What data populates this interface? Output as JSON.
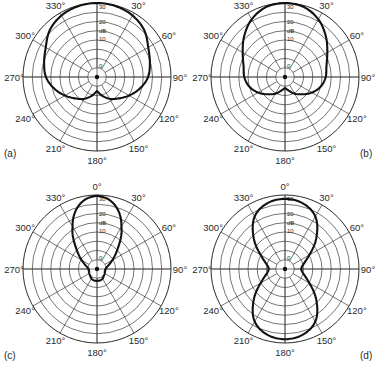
{
  "chart_data": [
    {
      "type": "polar_line",
      "panel_label": "(a)",
      "title": "",
      "radial_unit": "dB",
      "radial_ticks": [
        "0",
        "10",
        "dB",
        "20",
        "30"
      ],
      "angle_ticks": [
        "0°",
        "30°",
        "60°",
        "90°",
        "120°",
        "150°",
        "180°",
        "210°",
        "240°",
        "270°",
        "300°",
        "330°"
      ],
      "rings": 8,
      "angles_deg": [
        0,
        15,
        30,
        45,
        60,
        75,
        90,
        105,
        120,
        135,
        150,
        165,
        180
      ],
      "r_fraction": [
        1.0,
        0.99,
        0.96,
        0.9,
        0.8,
        0.74,
        0.69,
        0.6,
        0.5,
        0.41,
        0.34,
        0.26,
        0.19
      ],
      "symmetric": true
    },
    {
      "type": "polar_line",
      "panel_label": "(b)",
      "title": "",
      "radial_unit": "dB",
      "radial_ticks": [
        "0",
        "10",
        "dB",
        "20",
        "30"
      ],
      "angle_ticks": [
        "0°",
        "30°",
        "60°",
        "90°",
        "120°",
        "150°",
        "180°",
        "210°",
        "240°",
        "270°",
        "300°",
        "330°"
      ],
      "rings": 8,
      "angles_deg": [
        0,
        15,
        30,
        45,
        60,
        75,
        90,
        105,
        120,
        135,
        150,
        165,
        180
      ],
      "r_fraction": [
        1.0,
        0.98,
        0.9,
        0.78,
        0.66,
        0.58,
        0.55,
        0.5,
        0.42,
        0.33,
        0.26,
        0.19,
        0.15
      ],
      "symmetric": true
    },
    {
      "type": "polar_line",
      "panel_label": "(c)",
      "title": "",
      "radial_unit": "dB",
      "radial_ticks": [
        "0",
        "10",
        "dB",
        "20",
        "30"
      ],
      "angle_ticks": [
        "0°",
        "30°",
        "60°",
        "90°",
        "120°",
        "150°",
        "180°",
        "210°",
        "240°",
        "270°",
        "300°",
        "330°"
      ],
      "rings": 8,
      "angles_deg": [
        0,
        10,
        20,
        30,
        45,
        60,
        75,
        90,
        105,
        120,
        135,
        150,
        165,
        180
      ],
      "r_fraction": [
        0.99,
        0.95,
        0.84,
        0.66,
        0.4,
        0.24,
        0.15,
        0.115,
        0.11,
        0.12,
        0.13,
        0.15,
        0.16,
        0.16
      ],
      "symmetric": true
    },
    {
      "type": "polar_line",
      "panel_label": "(d)",
      "title": "",
      "radial_unit": "dB",
      "radial_ticks": [
        "0",
        "10",
        "dB",
        "20",
        "30"
      ],
      "angle_ticks": [
        "0°",
        "30°",
        "60°",
        "90°",
        "120°",
        "150°",
        "180°",
        "210°",
        "240°",
        "270°",
        "300°",
        "330°"
      ],
      "rings": 8,
      "angles_deg": [
        0,
        15,
        30,
        45,
        60,
        75,
        90,
        105,
        120,
        135,
        150,
        165,
        180
      ],
      "r_fraction": [
        0.95,
        0.92,
        0.82,
        0.6,
        0.38,
        0.26,
        0.22,
        0.26,
        0.38,
        0.6,
        0.82,
        0.92,
        0.95
      ],
      "symmetric": true
    }
  ],
  "panels": [
    {
      "label": "(a)",
      "cx": 97,
      "cy": 77,
      "label_x": 4,
      "label_y": 157,
      "show_zero_label": false
    },
    {
      "label": "(b)",
      "cx": 285,
      "cy": 77,
      "label_x": 360,
      "label_y": 157,
      "show_zero_label": false
    },
    {
      "label": "(c)",
      "cx": 97,
      "cy": 269,
      "label_x": 4,
      "label_y": 359,
      "show_zero_label": true
    },
    {
      "label": "(d)",
      "cx": 285,
      "cy": 269,
      "label_x": 360,
      "label_y": 359,
      "show_zero_label": true
    }
  ],
  "outer_radius": 74,
  "colors": {
    "grid": "#3a3a3a",
    "pattern": "#111111",
    "text": "#2a2a2a"
  }
}
